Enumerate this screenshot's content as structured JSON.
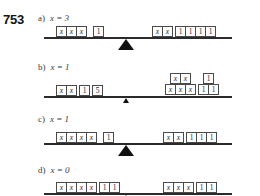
{
  "problem": {
    "number": "753"
  },
  "parts": [
    {
      "letter": "a)",
      "answer_lhs": "x",
      "answer_op": "=",
      "answer_rhs": "3",
      "answer_full": "x = 3",
      "left_pan": {
        "groups": [
          {
            "tiles": [
              "x",
              "x",
              "x"
            ]
          },
          {
            "tiles": [
              "1"
            ]
          }
        ]
      },
      "right_pan": {
        "groups": [
          {
            "tiles": [
              "x",
              "x"
            ]
          },
          {
            "tiles": [
              "1",
              "1",
              "1",
              "1"
            ]
          }
        ]
      }
    },
    {
      "letter": "b)",
      "answer_lhs": "x",
      "answer_op": "=",
      "answer_rhs": "1",
      "answer_full": "x = 1",
      "left_pan": {
        "groups": [
          {
            "tiles": [
              "x",
              "x"
            ]
          },
          {
            "tiles": [
              "1"
            ]
          },
          {
            "tiles": [
              "5"
            ]
          }
        ]
      },
      "right_pan": {
        "stacked": true,
        "top_row": [
          {
            "tiles": [
              "x",
              "x"
            ]
          },
          {
            "tiles": [
              "1"
            ]
          }
        ],
        "bottom_row": [
          {
            "tiles": [
              "x",
              "x",
              "x"
            ]
          },
          {
            "tiles": [
              "1",
              "1"
            ]
          }
        ]
      }
    },
    {
      "letter": "c)",
      "answer_lhs": "x",
      "answer_op": "=",
      "answer_rhs": "1",
      "answer_full": "x = 1",
      "left_pan": {
        "groups": [
          {
            "tiles": [
              "x",
              "x",
              "x",
              "x"
            ]
          },
          {
            "tiles": [
              "1"
            ]
          }
        ]
      },
      "right_pan": {
        "groups": [
          {
            "tiles": [
              "x",
              "x"
            ]
          },
          {
            "tiles": [
              "1",
              "1",
              "1"
            ]
          }
        ]
      }
    },
    {
      "letter": "d)",
      "answer_lhs": "x",
      "answer_op": "=",
      "answer_rhs": "0",
      "answer_full": "x = 0",
      "left_pan": {
        "groups": [
          {
            "tiles": [
              "x",
              "x",
              "x",
              "x"
            ]
          },
          {
            "tiles": [
              "1",
              "1"
            ]
          }
        ]
      },
      "right_pan": {
        "groups": [
          {
            "tiles": [
              "x",
              "x",
              "x"
            ]
          },
          {
            "tiles": [
              "1",
              "1"
            ]
          }
        ]
      }
    }
  ],
  "colors": {
    "ink": "#1a1a1a",
    "beam": "#2b2b2b",
    "fulcrum": "#111111",
    "tile_border": "#4a4a4a",
    "tile_fill": "#ffffff"
  }
}
